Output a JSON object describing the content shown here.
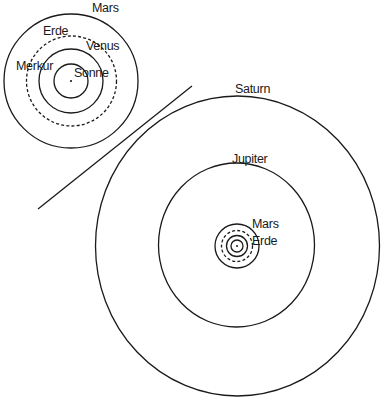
{
  "diagram": {
    "title": "",
    "inner_system": {
      "center": {
        "label": "Sonne"
      },
      "orbits": [
        {
          "name": "Merkur",
          "label": "Merkur",
          "style": "solid"
        },
        {
          "name": "Venus",
          "label": "Venus",
          "style": "solid"
        },
        {
          "name": "Erde",
          "label": "Erde",
          "style": "dashed"
        },
        {
          "name": "Mars",
          "label": "Mars",
          "style": "solid"
        }
      ]
    },
    "outer_system": {
      "orbits": [
        {
          "name": "Saturn",
          "label": "Saturn",
          "style": "solid"
        },
        {
          "name": "Jupiter",
          "label": "Jupiter",
          "style": "solid"
        },
        {
          "name": "Mars",
          "label": "Mars",
          "style": "solid"
        },
        {
          "name": "Erde",
          "label": "Erde",
          "style": "dashed"
        }
      ]
    },
    "colors": {
      "line": "#1a1a1a",
      "background": "#ffffff"
    }
  }
}
